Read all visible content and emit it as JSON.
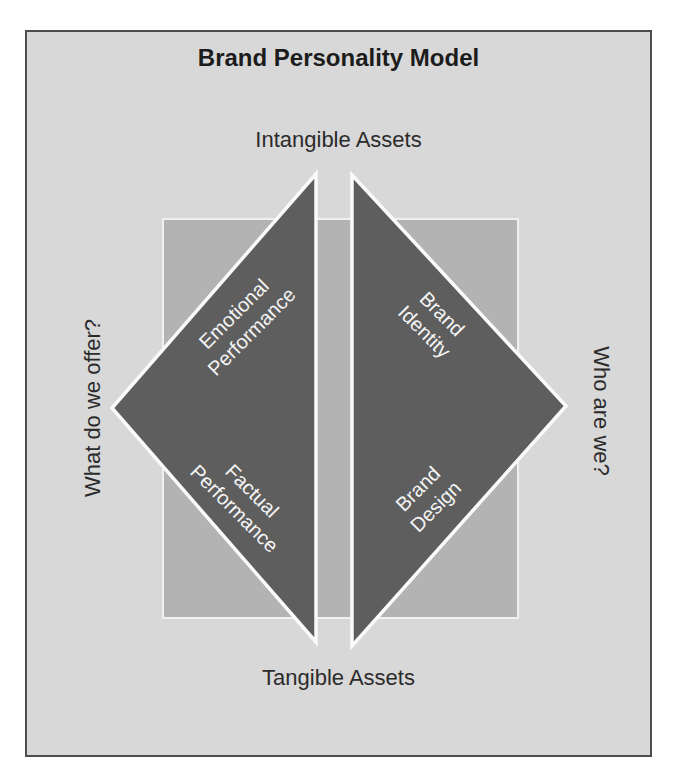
{
  "diagram": {
    "title": "Brand Personality Model",
    "axis_labels": {
      "top": "Intangible Assets",
      "bottom": "Tangible Assets",
      "left": "What do we offer?",
      "right": "Who are we?"
    },
    "quadrants": {
      "left_top": {
        "line1": "Emotional",
        "line2": "Performance"
      },
      "left_bottom": {
        "line1": "Factual",
        "line2": "Performance"
      },
      "right_top": {
        "line1": "Brand",
        "line2": "Identity"
      },
      "right_bottom": {
        "line1": "Brand",
        "line2": "Design"
      }
    }
  },
  "colors": {
    "page_bg": "#ffffff",
    "frame_bg": "#d8d8d8",
    "frame_border": "#4d4d4d",
    "square_fill": "#b3b3b3",
    "square_outline": "#f0f0f0",
    "triangle_fill": "#5e5e5e",
    "triangle_outline": "#fafafa",
    "text_dark": "#2b2b2b",
    "text_light": "#f5f5f5"
  }
}
